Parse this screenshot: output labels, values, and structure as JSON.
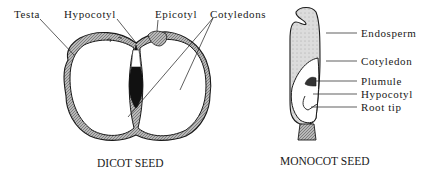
{
  "dicot": {
    "caption": "DICOT SEED",
    "labels": {
      "testa": "Testa",
      "hypocotyl": "Hypocotyl",
      "epicotyl": "Epicotyl",
      "cotyledons": "Cotyledons"
    }
  },
  "monocot": {
    "caption": "MONOCOT SEED",
    "labels": {
      "endosperm": "Endosperm",
      "cotyledon": "Cotyledon",
      "plumule": "Plumule",
      "hypocotyl": "Hypocotyl",
      "root_tip": "Root tip"
    }
  },
  "colors": {
    "ink": "#1a1a1a",
    "testa_fill": "#9a9a9a",
    "endosperm_fill": "#d4d4d4",
    "background": "#ffffff"
  }
}
